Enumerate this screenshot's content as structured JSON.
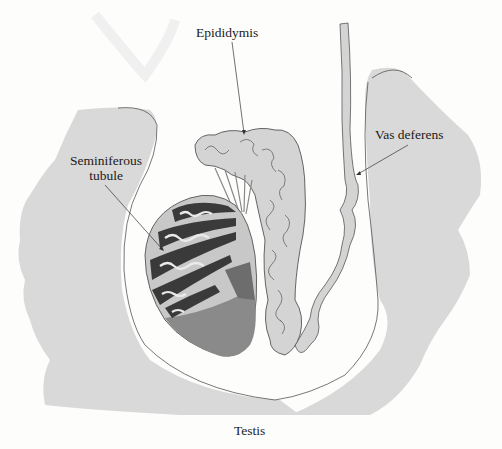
{
  "diagram": {
    "labels": {
      "epididymis": "Epididymis",
      "vas_deferens": "Vas deferens",
      "seminiferous_line1": "Seminiferous",
      "seminiferous_line2": "tubule",
      "testis": "Testis"
    },
    "colors": {
      "background": "#fdfdfc",
      "body_tissue": "#d9d9d9",
      "duct_fill": "#d4d4d4",
      "testis_lower": "#8a8a8a",
      "tubule_dark": "#3a3a3a",
      "outline": "#555555"
    }
  }
}
